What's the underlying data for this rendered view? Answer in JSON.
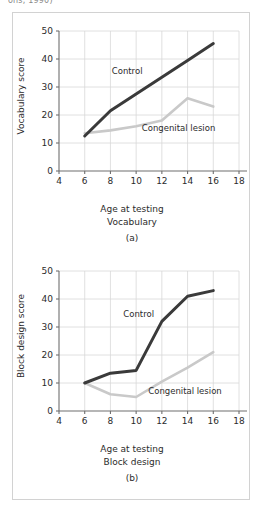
{
  "figure": {
    "top_citation_fragment": "ons, 1990)",
    "border_color": "#d2d2d2"
  },
  "colors": {
    "control_line": "#3a3a3a",
    "lesion_line": "#c9c9c9",
    "grid": "#d8d8d8",
    "axis": "#6f6f6f",
    "text": "#2b2b2b"
  },
  "panels": [
    {
      "id": "a",
      "letter": "(a)",
      "xlabel": "Age at testing",
      "subtitle": "Vocabulary",
      "ylabel": "Vocabulary score",
      "series_labels": {
        "control": "Control",
        "lesion": "Congenital lesion"
      }
    },
    {
      "id": "b",
      "letter": "(b)",
      "xlabel": "Age at testing",
      "subtitle": "Block design",
      "ylabel": "Block design score",
      "series_labels": {
        "control": "Control",
        "lesion": "Congenital lesion"
      }
    }
  ],
  "chart_data": [
    {
      "type": "line",
      "title": "Vocabulary",
      "panel": "(a)",
      "xlabel": "Age at testing",
      "ylabel": "Vocabulary score",
      "xlim": [
        4,
        18
      ],
      "ylim": [
        0,
        50
      ],
      "xticks": [
        4,
        6,
        8,
        10,
        12,
        14,
        16,
        18
      ],
      "yticks": [
        0,
        10,
        20,
        30,
        40,
        50
      ],
      "grid": true,
      "legend": "inline-annotations",
      "x": [
        6,
        8,
        10,
        12,
        14,
        16
      ],
      "series": [
        {
          "name": "Control",
          "values": [
            12.5,
            21.5,
            27.5,
            33.5,
            39.5,
            45.5
          ],
          "color": "#3a3a3a"
        },
        {
          "name": "Congenital lesion",
          "values": [
            13.5,
            14.5,
            16,
            18,
            26,
            23
          ],
          "color": "#c9c9c9"
        }
      ]
    },
    {
      "type": "line",
      "title": "Block design",
      "panel": "(b)",
      "xlabel": "Age at testing",
      "ylabel": "Block design score",
      "xlim": [
        4,
        18
      ],
      "ylim": [
        0,
        50
      ],
      "xticks": [
        4,
        6,
        8,
        10,
        12,
        14,
        16,
        18
      ],
      "yticks": [
        0,
        10,
        20,
        30,
        40,
        50
      ],
      "grid": true,
      "legend": "inline-annotations",
      "x": [
        6,
        8,
        10,
        12,
        14,
        16
      ],
      "series": [
        {
          "name": "Control",
          "values": [
            10,
            13.5,
            14.5,
            32,
            41,
            43
          ],
          "color": "#3a3a3a"
        },
        {
          "name": "Congenital lesion",
          "values": [
            10,
            6,
            5,
            10.5,
            15.5,
            21
          ],
          "color": "#c9c9c9"
        }
      ]
    }
  ]
}
